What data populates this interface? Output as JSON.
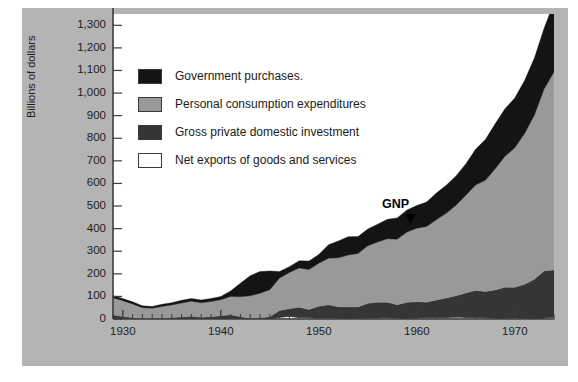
{
  "chart_data": {
    "type": "area",
    "stacked": true,
    "title": "",
    "subtitle": "",
    "xlabel": "",
    "ylabel": "Billions of dollars",
    "xlim": [
      1929,
      1974
    ],
    "ylim": [
      0,
      1350
    ],
    "ytick_step": 100,
    "grid": false,
    "legend_position": "upper-left-inside",
    "annotations": [
      {
        "text": "GNP",
        "x": 1959,
        "y": 510,
        "points_to": "total-gnp-boundary"
      }
    ],
    "ytick_labels": [
      "0",
      "100",
      "200",
      "300",
      "400",
      "500",
      "600",
      "700",
      "800",
      "900",
      "1,000",
      "1,100",
      "1,200",
      "1,300"
    ],
    "ytick_values": [
      0,
      100,
      200,
      300,
      400,
      500,
      600,
      700,
      800,
      900,
      1000,
      1100,
      1200,
      1300
    ],
    "xtick_labels": [
      "1930",
      "1940",
      "1950",
      "1960",
      "1970"
    ],
    "xtick_values": [
      1930,
      1940,
      1950,
      1960,
      1970
    ],
    "x_minor_tick_interval": 1,
    "x": [
      1929,
      1930,
      1931,
      1932,
      1933,
      1934,
      1935,
      1936,
      1937,
      1938,
      1939,
      1940,
      1941,
      1942,
      1943,
      1944,
      1945,
      1946,
      1947,
      1948,
      1949,
      1950,
      1951,
      1952,
      1953,
      1954,
      1955,
      1956,
      1957,
      1958,
      1959,
      1960,
      1961,
      1962,
      1963,
      1964,
      1965,
      1966,
      1967,
      1968,
      1969,
      1970,
      1971,
      1972,
      1973,
      1974
    ],
    "series": [
      {
        "name": "Net exports of goods and services",
        "color": "#ffffff",
        "stack_order": 1,
        "values": [
          1.1,
          1.0,
          0.5,
          0.4,
          0.4,
          0.6,
          0.1,
          0.1,
          0.3,
          1.1,
          1.1,
          1.5,
          1.0,
          -0.2,
          -2.2,
          -2.0,
          -0.8,
          7.2,
          11.5,
          6.4,
          6.1,
          1.8,
          3.7,
          2.2,
          0.4,
          1.8,
          2.0,
          4.0,
          5.7,
          2.2,
          0.1,
          4.1,
          5.2,
          5.0,
          5.6,
          8.5,
          6.9,
          5.3,
          5.2,
          2.5,
          1.9,
          3.9,
          0.6,
          -3.3,
          4.0,
          7.6
        ]
      },
      {
        "name": "Gross private domestic investment",
        "color": "#353535",
        "stack_order": 2,
        "values": [
          16.2,
          10.3,
          5.6,
          1.0,
          1.4,
          3.3,
          6.4,
          8.5,
          11.8,
          6.5,
          9.3,
          13.1,
          17.9,
          9.9,
          5.8,
          7.2,
          10.6,
          30.7,
          34.0,
          46.0,
          35.7,
          54.1,
          59.3,
          51.9,
          52.6,
          51.7,
          67.4,
          70.0,
          67.9,
          60.9,
          73.6,
          72.4,
          69.0,
          79.4,
          87.1,
          94.0,
          108.1,
          121.4,
          116.6,
          126.0,
          139.0,
          136.3,
          153.2,
          179.3,
          209.4,
          209.4
        ]
      },
      {
        "name": "Personal consumption expenditures",
        "color": "#999999",
        "stack_order": 3,
        "values": [
          77.2,
          69.9,
          60.5,
          48.6,
          45.8,
          51.3,
          55.7,
          61.9,
          66.5,
          63.9,
          66.8,
          70.8,
          80.6,
          88.5,
          99.3,
          108.3,
          119.7,
          143.4,
          160.7,
          173.6,
          176.8,
          191.0,
          206.3,
          216.7,
          230.0,
          236.5,
          254.4,
          266.7,
          281.4,
          290.1,
          311.2,
          325.2,
          335.2,
          355.1,
          375.0,
          401.2,
          432.8,
          466.3,
          492.1,
          536.2,
          579.5,
          617.6,
          667.2,
          726.5,
          805.2,
          876.7
        ]
      },
      {
        "name": "Government purchases",
        "color": "#141414",
        "stack_order": 4,
        "values": [
          8.5,
          9.2,
          9.2,
          8.1,
          8.0,
          9.8,
          10.0,
          12.0,
          11.9,
          13.0,
          13.3,
          14.0,
          24.8,
          59.7,
          88.6,
          96.5,
          82.9,
          29.1,
          25.5,
          31.6,
          37.8,
          38.8,
          59.5,
          74.7,
          81.6,
          74.8,
          74.2,
          78.6,
          86.1,
          94.2,
          97.6,
          100.6,
          108.3,
          118.2,
          123.8,
          129.7,
          138.4,
          158.7,
          180.1,
          199.6,
          210.0,
          220.5,
          234.4,
          252.8,
          269.2,
          307.8
        ]
      }
    ],
    "total_label": "GNP",
    "totals": [
      103.1,
      90.4,
      75.8,
      58.0,
      55.6,
      65.0,
      72.2,
      82.5,
      90.4,
      84.7,
      90.5,
      99.7,
      124.5,
      157.9,
      191.6,
      210.1,
      211.9,
      208.5,
      231.3,
      257.6,
      256.5,
      284.8,
      328.4,
      345.5,
      364.6,
      364.8,
      398.0,
      419.2,
      441.1,
      447.3,
      483.7,
      503.7,
      518.1,
      554.9,
      591.2,
      632.4,
      684.9,
      749.9,
      793.9,
      864.2,
      930.3,
      977.1,
      1054.9,
      1158.0,
      1294.9,
      1397.4
    ]
  },
  "chart": {
    "ylabel": "Billions of dollars",
    "ytick_labels": [
      "1,300",
      "1,200",
      "1,100",
      "1,000",
      "900",
      "800",
      "700",
      "600",
      "500",
      "400",
      "300",
      "200",
      "100",
      "0"
    ],
    "xtick_labels": [
      "1930",
      "1940",
      "1950",
      "1960",
      "1970"
    ],
    "gnp_annotation": "GNP"
  },
  "legend": {
    "items": [
      {
        "label": "Government purchases.",
        "swatch": "#141414",
        "swatch_name": "legend-swatch-government-purchases"
      },
      {
        "label": "Personal consumption expenditures",
        "swatch": "#999999",
        "swatch_name": "legend-swatch-personal-consumption"
      },
      {
        "label": "Gross private domestic investment",
        "swatch": "#353535",
        "swatch_name": "legend-swatch-private-investment"
      },
      {
        "label": "Net exports of goods and services",
        "swatch": "#ffffff",
        "swatch_name": "legend-swatch-net-exports"
      }
    ]
  },
  "colors": {
    "background_mat": "#b4b4b4",
    "plot_background": "#ffffff",
    "axis": "#3c3c3c",
    "text": "#1c1c1c",
    "government_purchases": "#141414",
    "personal_consumption": "#999999",
    "private_investment": "#353535",
    "net_exports": "#ffffff"
  }
}
